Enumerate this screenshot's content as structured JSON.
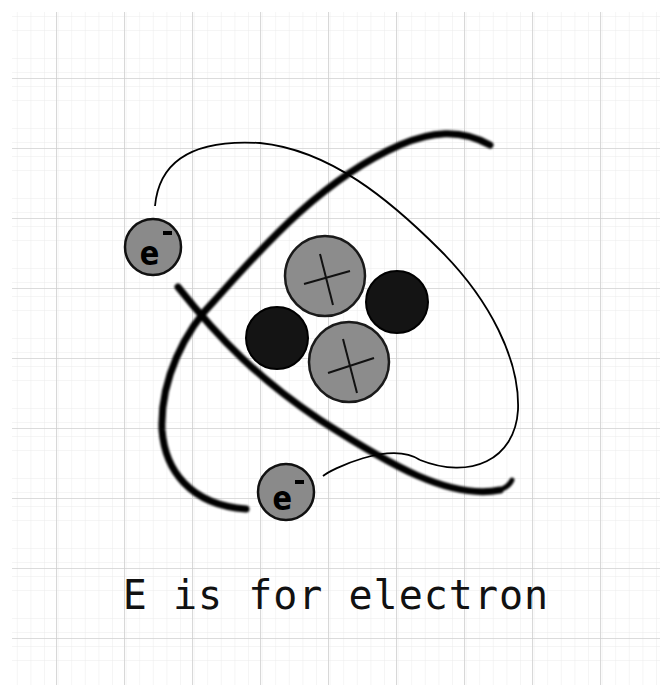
{
  "diagram": {
    "caption": "E is for electron",
    "electron_label": "e",
    "electron_charge": "-",
    "colors": {
      "background": "#ffffff",
      "grid_major": "#cfcfcf",
      "grid_minor": "#ececec",
      "proton_fill": "#8c8c8c",
      "neutron_fill": "#141414",
      "electron_fill": "#8a8a8a",
      "orbit_stroke": "#000000"
    },
    "nucleus": {
      "protons": [
        {
          "label": "proton-top",
          "cx": 325,
          "cy": 276,
          "r": 40
        },
        {
          "label": "proton-bottom",
          "cx": 349,
          "cy": 362,
          "r": 40
        }
      ],
      "neutrons": [
        {
          "label": "neutron-left",
          "cx": 277,
          "cy": 338,
          "r": 31
        },
        {
          "label": "neutron-right",
          "cx": 397,
          "cy": 302,
          "r": 31
        }
      ]
    },
    "electrons": [
      {
        "label": "electron-upper-left",
        "cx": 153,
        "cy": 247,
        "r": 28
      },
      {
        "label": "electron-bottom",
        "cx": 286,
        "cy": 492,
        "r": 28
      }
    ]
  }
}
